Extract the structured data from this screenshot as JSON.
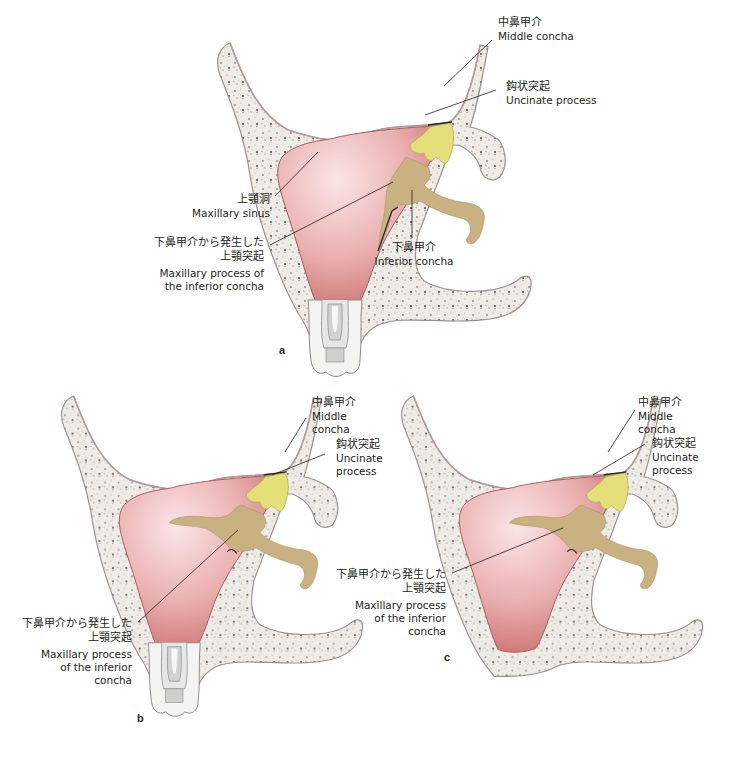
{
  "figure": {
    "colors": {
      "bone_fill": "#f3f1ee",
      "bone_outline": "#9a8f8f",
      "sinus_mucosa": "#d98f8f",
      "sinus_center": "#fbe3e3",
      "uncinate": "#e5df7a",
      "inferior_concha": "#c9b182",
      "leader_line": "#231f20"
    },
    "panels": [
      {
        "letter": "a",
        "labels": {
          "middle_concha": {
            "jp": "中鼻甲介",
            "en": "Middle concha"
          },
          "uncinate": {
            "jp": "鈎状突起",
            "en": "Uncinate process"
          },
          "maxillary_sinus": {
            "jp": "上顎洞",
            "en": "Maxillary sinus"
          },
          "maxillary_process": {
            "jp1": "下鼻甲介から発生した",
            "jp2": "上顎突起",
            "en1": "Maxillary process of",
            "en2": "the inferior concha"
          },
          "inferior_concha": {
            "jp": "下鼻甲介",
            "en": "Inferior concha"
          }
        }
      },
      {
        "letter": "b",
        "labels": {
          "middle_concha": {
            "jp": "中鼻甲介",
            "en1": "Middle",
            "en2": "concha"
          },
          "uncinate": {
            "jp": "鈎状突起",
            "en1": "Uncinate",
            "en2": "process"
          },
          "maxillary_process": {
            "jp1": "下鼻甲介から発生した",
            "jp2": "上顎突起",
            "en1": "Maxillary process",
            "en2": "of the inferior",
            "en3": "concha"
          }
        }
      },
      {
        "letter": "c",
        "labels": {
          "middle_concha": {
            "jp": "中鼻甲介",
            "en1": "Middle",
            "en2": "concha"
          },
          "uncinate": {
            "jp": "鈎状突起",
            "en1": "Uncinate",
            "en2": "process"
          },
          "maxillary_process": {
            "jp1": "下鼻甲介から発生した",
            "jp2": "上顎突起",
            "en1": "Maxillary process",
            "en2": "of the inferior",
            "en3": "concha"
          }
        }
      }
    ]
  }
}
